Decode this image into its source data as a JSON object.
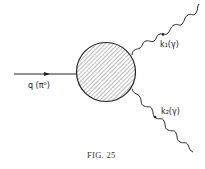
{
  "figure": {
    "caption": "FIG. 25"
  },
  "incoming": {
    "label": "q (π⁰)",
    "momentum": "q",
    "particle": "π⁰"
  },
  "outgoing": [
    {
      "label": "k₁(γ)",
      "momentum": "k₁",
      "particle": "γ"
    },
    {
      "label": "k₂(γ)",
      "momentum": "k₂",
      "particle": "γ"
    }
  ],
  "colors": {
    "line": "#222222",
    "hatch": "#555555",
    "background": "#ffffff"
  }
}
